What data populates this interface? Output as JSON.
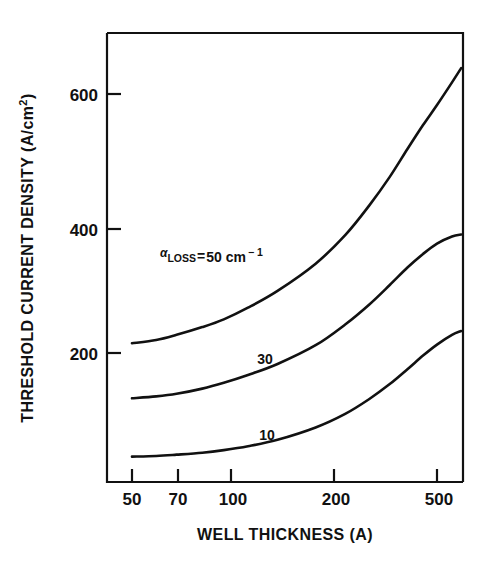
{
  "chart_data": {
    "type": "line",
    "title": "",
    "xlabel": "WELL THICKNESS (A)",
    "ylabel": "THRESHOLD CURRENT DENSITY (A/cm",
    "ylabel_sup": "2",
    "ylabel_tail": ")",
    "xscale": "log",
    "yscale": "linear",
    "xlim": [
      45,
      620
    ],
    "ylim": [
      0,
      700
    ],
    "xticks": [
      50,
      70,
      100,
      200,
      500
    ],
    "xticklabels": [
      "50",
      "70",
      "100",
      "200",
      "500"
    ],
    "yticks": [
      200,
      400,
      600
    ],
    "yticklabels": [
      "200",
      "400",
      "600"
    ],
    "grid": false,
    "legend": "inline-annotations",
    "annotation": {
      "alpha": "α",
      "subscript": "LOSS",
      "equals": "=",
      "value": "50 cm",
      "exponent": "− 1",
      "full_text": "αLOSS = 50 cm−1"
    },
    "series": [
      {
        "name": "50",
        "label": "αLOSS = 50 cm−1",
        "inline_label": "",
        "x": [
          50,
          60,
          70,
          85,
          100,
          120,
          150,
          200,
          250,
          300,
          350,
          400,
          450,
          500,
          560,
          600
        ],
        "y": [
          215,
          220,
          228,
          240,
          252,
          270,
          296,
          338,
          382,
          428,
          472,
          515,
          552,
          583,
          618,
          640
        ]
      },
      {
        "name": "30",
        "label": "30",
        "inline_label": "30",
        "x": [
          50,
          60,
          70,
          85,
          100,
          120,
          150,
          200,
          250,
          300,
          350,
          400,
          450,
          500,
          560,
          600
        ],
        "y": [
          130,
          133,
          137,
          145,
          154,
          166,
          183,
          212,
          244,
          275,
          305,
          332,
          353,
          369,
          380,
          383
        ]
      },
      {
        "name": "10",
        "label": "10",
        "inline_label": "10",
        "x": [
          50,
          60,
          70,
          85,
          100,
          120,
          150,
          200,
          250,
          300,
          350,
          400,
          450,
          500,
          560,
          600
        ],
        "y": [
          40,
          41,
          43,
          46,
          50,
          56,
          66,
          85,
          106,
          129,
          152,
          175,
          196,
          213,
          228,
          234
        ]
      }
    ],
    "colors": {
      "axis": "#111111",
      "curve": "#111111",
      "background": "#ffffff"
    }
  }
}
